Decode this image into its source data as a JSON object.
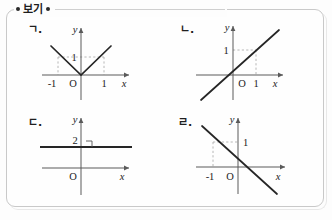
{
  "header": {
    "label": "보기",
    "left_bullet": "bullet-dot",
    "right_bullet": "bullet-dot"
  },
  "panels": [
    {
      "id": "panel-a",
      "label": "ㄱ.",
      "graph_kind": "absolute-value",
      "description": "V-shaped graph y = |x| with vertex at the origin",
      "origin_label": "O",
      "x_axis_label": "x",
      "y_axis_label": "y",
      "ticks": [
        {
          "axis": "x",
          "value": "-1"
        },
        {
          "axis": "x",
          "value": "1"
        },
        {
          "axis": "y",
          "value": "1"
        }
      ],
      "guides": [
        "x=-1 up to y=1",
        "x=1 up to y=1",
        "y=1 across"
      ]
    },
    {
      "id": "panel-b",
      "label": "ㄴ.",
      "graph_kind": "line-positive-slope",
      "description": "Straight line y = x through the origin",
      "origin_label": "O",
      "x_axis_label": "x",
      "y_axis_label": "y",
      "ticks": [
        {
          "axis": "x",
          "value": "1"
        },
        {
          "axis": "y",
          "value": "1"
        }
      ],
      "guides": [
        "x=1 up to y=1",
        "y=1 across to x=1"
      ]
    },
    {
      "id": "panel-c",
      "label": "ㄷ.",
      "graph_kind": "horizontal-line",
      "description": "Horizontal line y = 2 with a right-angle mark at the y-axis",
      "origin_label": "O",
      "x_axis_label": "x",
      "y_axis_label": "y",
      "ticks": [
        {
          "axis": "y",
          "value": "2"
        }
      ],
      "guides": [
        "right-angle mark at (0,2)"
      ]
    },
    {
      "id": "panel-d",
      "label": "ㄹ.",
      "graph_kind": "line-negative-slope",
      "description": "Straight line y = -x through the origin",
      "origin_label": "O",
      "x_axis_label": "x",
      "y_axis_label": "y",
      "ticks": [
        {
          "axis": "x",
          "value": "-1"
        },
        {
          "axis": "y",
          "value": "1"
        }
      ],
      "guides": [
        "x=-1 up to y=1",
        "y=1 across to x=-1"
      ]
    }
  ],
  "colors": {
    "ink": "#1c1c1c",
    "axis": "#555555",
    "curve": "#2b2b2b",
    "guide": "#9a9a9a",
    "frame": "#c9c9c9",
    "page": "#fdfdfd"
  }
}
